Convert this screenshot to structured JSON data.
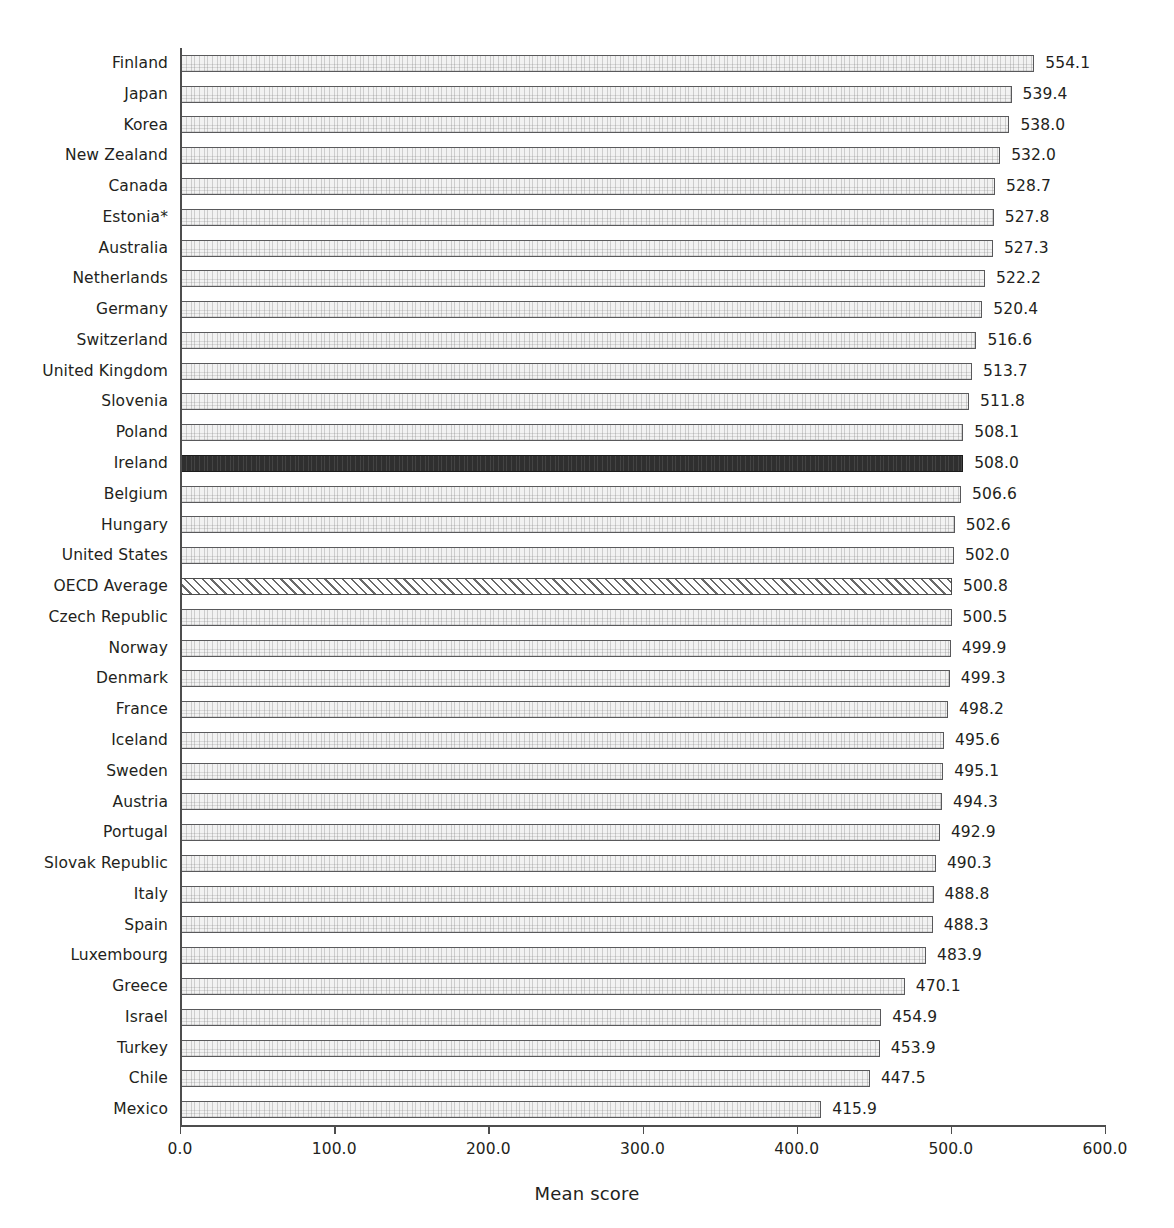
{
  "chart_data": {
    "type": "bar",
    "orientation": "horizontal",
    "title": "",
    "xlabel": "Mean score",
    "ylabel": "",
    "xlim": [
      0.0,
      600.0
    ],
    "xticks": [
      "0.0",
      "100.0",
      "200.0",
      "300.0",
      "400.0",
      "500.0",
      "600.0"
    ],
    "xtick_values": [
      0,
      100,
      200,
      300,
      400,
      500,
      600
    ],
    "grid": false,
    "legend": "none",
    "categories": [
      "Finland",
      "Japan",
      "Korea",
      "New Zealand",
      "Canada",
      "Estonia*",
      "Australia",
      "Netherlands",
      "Germany",
      "Switzerland",
      "United Kingdom",
      "Slovenia",
      "Poland",
      "Ireland",
      "Belgium",
      "Hungary",
      "United States",
      "OECD Average",
      "Czech Republic",
      "Norway",
      "Denmark",
      "France",
      "Iceland",
      "Sweden",
      "Austria",
      "Portugal",
      "Slovak Republic",
      "Italy",
      "Spain",
      "Luxembourg",
      "Greece",
      "Israel",
      "Turkey",
      "Chile",
      "Mexico"
    ],
    "values": [
      554.1,
      539.4,
      538.0,
      532.0,
      528.7,
      527.8,
      527.3,
      522.2,
      520.4,
      516.6,
      513.7,
      511.8,
      508.1,
      508.0,
      506.6,
      502.6,
      502.0,
      500.8,
      500.5,
      499.9,
      499.3,
      498.2,
      495.6,
      495.1,
      494.3,
      492.9,
      490.3,
      488.8,
      488.3,
      483.9,
      470.1,
      454.9,
      453.9,
      447.5,
      415.9
    ],
    "value_labels": [
      "554.1",
      "539.4",
      "538.0",
      "532.0",
      "528.7",
      "527.8",
      "527.3",
      "522.2",
      "520.4",
      "516.6",
      "513.7",
      "511.8",
      "508.1",
      "508.0",
      "506.6",
      "502.6",
      "502.0",
      "500.8",
      "500.5",
      "499.9",
      "499.3",
      "498.2",
      "495.6",
      "495.1",
      "494.3",
      "492.9",
      "490.3",
      "488.8",
      "488.3",
      "483.9",
      "470.1",
      "454.9",
      "453.9",
      "447.5",
      "415.9"
    ],
    "styles": [
      "plain",
      "plain",
      "plain",
      "plain",
      "plain",
      "plain",
      "plain",
      "plain",
      "plain",
      "plain",
      "plain",
      "plain",
      "plain",
      "highlight",
      "plain",
      "plain",
      "plain",
      "hatched",
      "plain",
      "plain",
      "plain",
      "plain",
      "plain",
      "plain",
      "plain",
      "plain",
      "plain",
      "plain",
      "plain",
      "plain",
      "plain",
      "plain",
      "plain",
      "plain",
      "plain"
    ]
  },
  "colors": {
    "bar_fill": "#f2f2f2",
    "bar_border": "#59595b",
    "highlight_fill": "#2f2f2f",
    "hatch_stroke": "#6a6a6a",
    "axis": "#4d4d4d",
    "text": "#231f20",
    "background": "#ffffff"
  }
}
